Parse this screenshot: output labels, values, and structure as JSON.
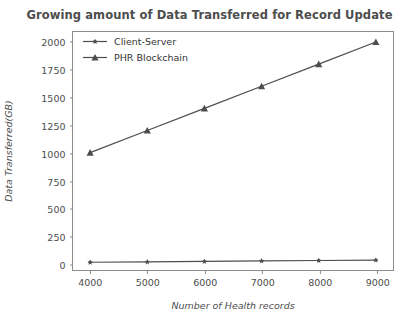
{
  "chart_data": {
    "type": "line",
    "title": "Growing amount of Data Transferred for Record Update",
    "xlabel": "Number of Health records",
    "ylabel": "Data Transferred(GB)",
    "x": [
      4000,
      5000,
      6000,
      7000,
      8000,
      9000
    ],
    "xticks": [
      "4000",
      "5000",
      "6000",
      "7000",
      "8000",
      "9000"
    ],
    "yticks": [
      "0",
      "250",
      "500",
      "750",
      "1000",
      "1250",
      "1500",
      "1750",
      "2000"
    ],
    "ytick_values": [
      0,
      250,
      500,
      750,
      1000,
      1250,
      1500,
      1750,
      2000
    ],
    "xlim": [
      3700,
      9300
    ],
    "ylim": [
      -60,
      2090
    ],
    "grid": false,
    "legend_position": "upper left",
    "series": [
      {
        "name": "Client-Server",
        "values": [
          10,
          14,
          18,
          22,
          26,
          30
        ],
        "color": "#4d4d4d",
        "marker": "star"
      },
      {
        "name": "PHR Blockchain",
        "values": [
          1000,
          1200,
          1400,
          1600,
          1800,
          2000
        ],
        "color": "#4d4d4d",
        "marker": "triangle-up"
      }
    ]
  },
  "colors": {
    "line": "#4d4d4d",
    "axis": "#8c8c8c",
    "text": "#4d4d4d",
    "background": "#ffffff"
  }
}
